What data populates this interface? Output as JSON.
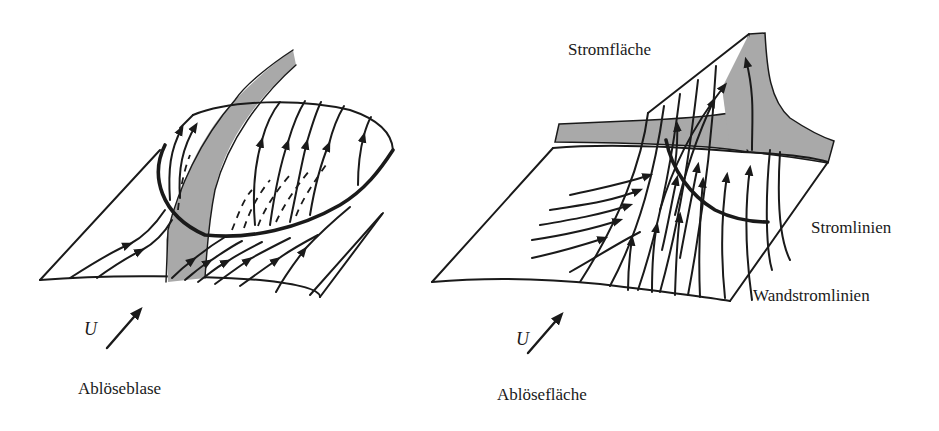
{
  "figure": {
    "left_panel": {
      "caption": "Ablöseblase",
      "flow_symbol": "U",
      "elements": [
        "wall-surface",
        "separation-bubble",
        "grey-stream-surface",
        "wall-streamlines",
        "reverse-flow-dashed-lines"
      ]
    },
    "right_panel": {
      "caption": "Ablösefläche",
      "flow_symbol": "U",
      "labels": {
        "stream_surface": "Stromfläche",
        "streamlines": "Stromlinien",
        "wall_streamlines": "Wandstromlinien"
      },
      "elements": [
        "wall-surface",
        "separation-surface",
        "grey-stream-surface",
        "streamlines",
        "separation-line"
      ]
    },
    "colors": {
      "line": "#1a1a1a",
      "surface_fill": "#a9a9a9",
      "background": "#ffffff"
    }
  }
}
